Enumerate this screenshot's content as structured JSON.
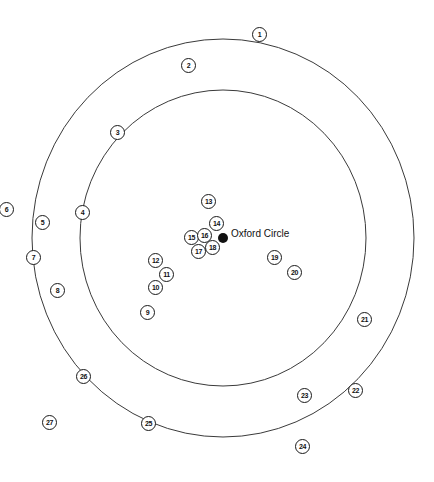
{
  "diagram": {
    "center": {
      "label": "Oxford Circle",
      "x": 223,
      "y": 238
    },
    "rings": [
      {
        "name": "outer-ring",
        "cx": 223,
        "cy": 238,
        "rx": 191,
        "ry": 199
      },
      {
        "name": "inner-ring",
        "cx": 223,
        "cy": 238,
        "rx": 143,
        "ry": 148
      }
    ],
    "markers": [
      {
        "label": "1",
        "x": 259,
        "y": 34
      },
      {
        "label": "2",
        "x": 188,
        "y": 65
      },
      {
        "label": "3",
        "x": 117,
        "y": 132
      },
      {
        "label": "4",
        "x": 82,
        "y": 212
      },
      {
        "label": "5",
        "x": 42,
        "y": 222
      },
      {
        "label": "6",
        "x": 6,
        "y": 209
      },
      {
        "label": "7",
        "x": 33,
        "y": 257
      },
      {
        "label": "8",
        "x": 57,
        "y": 290
      },
      {
        "label": "9",
        "x": 147,
        "y": 312
      },
      {
        "label": "10",
        "x": 155,
        "y": 287
      },
      {
        "label": "11",
        "x": 166,
        "y": 274
      },
      {
        "label": "12",
        "x": 155,
        "y": 260
      },
      {
        "label": "13",
        "x": 208,
        "y": 201
      },
      {
        "label": "14",
        "x": 216,
        "y": 223
      },
      {
        "label": "15",
        "x": 191,
        "y": 237
      },
      {
        "label": "16",
        "x": 204,
        "y": 235
      },
      {
        "label": "17",
        "x": 198,
        "y": 251
      },
      {
        "label": "18",
        "x": 212,
        "y": 247
      },
      {
        "label": "19",
        "x": 274,
        "y": 257
      },
      {
        "label": "20",
        "x": 294,
        "y": 272
      },
      {
        "label": "21",
        "x": 364,
        "y": 319
      },
      {
        "label": "22",
        "x": 355,
        "y": 390
      },
      {
        "label": "23",
        "x": 304,
        "y": 395
      },
      {
        "label": "24",
        "x": 302,
        "y": 446
      },
      {
        "label": "25",
        "x": 148,
        "y": 423
      },
      {
        "label": "26",
        "x": 83,
        "y": 376
      },
      {
        "label": "27",
        "x": 49,
        "y": 422
      }
    ]
  },
  "colors": {
    "line": "#3a3a3a",
    "marker_border": "#1a1a1a",
    "text": "#111111",
    "background": "#ffffff"
  }
}
